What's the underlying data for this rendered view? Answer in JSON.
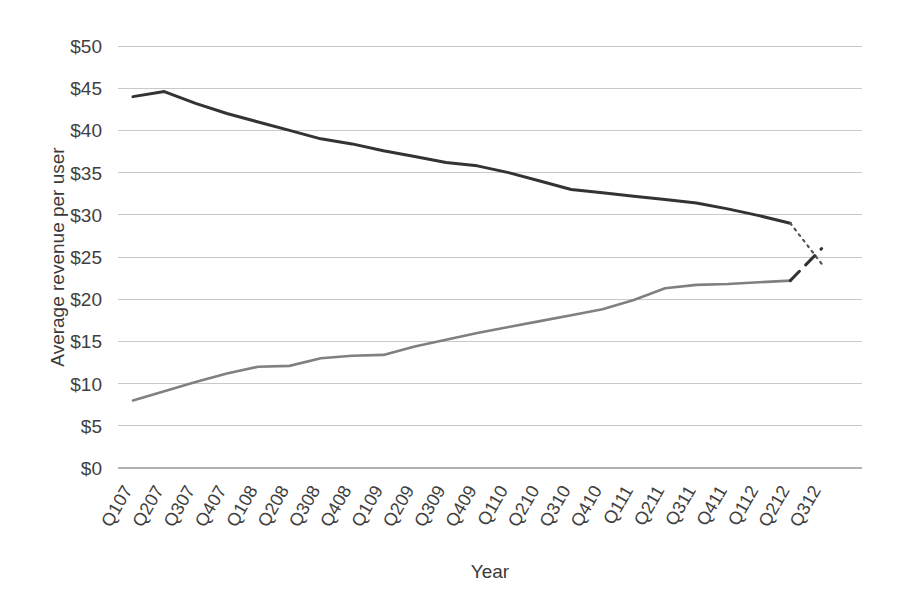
{
  "chart_data": {
    "type": "line",
    "title": "",
    "xlabel": "Year",
    "ylabel": "Average revenue per user",
    "ylim": [
      0,
      50
    ],
    "ytick_values": [
      0,
      5,
      10,
      15,
      20,
      25,
      30,
      35,
      40,
      45,
      50
    ],
    "ytick_labels": [
      "$0",
      "$5",
      "$10",
      "$15",
      "$20",
      "$25",
      "$30",
      "$35",
      "$40",
      "$45",
      "$50"
    ],
    "grid": true,
    "legend": "none",
    "categories": [
      "Q107",
      "Q207",
      "Q307",
      "Q407",
      "Q108",
      "Q208",
      "Q308",
      "Q408",
      "Q109",
      "Q209",
      "Q309",
      "Q409",
      "Q110",
      "Q210",
      "Q310",
      "Q410",
      "Q111",
      "Q211",
      "Q311",
      "Q411",
      "Q112",
      "Q212",
      "Q312"
    ],
    "series": [
      {
        "name": "declining-revenue-actual",
        "style": "solid",
        "color": "#333333",
        "width": 3.0,
        "values": [
          44.0,
          44.6,
          43.2,
          42.0,
          41.0,
          40.0,
          39.0,
          38.4,
          37.6,
          36.9,
          36.2,
          35.8,
          35.0,
          34.0,
          33.0,
          32.6,
          32.2,
          31.8,
          31.4,
          30.7,
          29.9,
          29.0,
          null
        ]
      },
      {
        "name": "declining-revenue-forecast",
        "style": "dotted",
        "color": "#555555",
        "width": 2.2,
        "values": [
          null,
          null,
          null,
          null,
          null,
          null,
          null,
          null,
          null,
          null,
          null,
          null,
          null,
          null,
          null,
          null,
          null,
          null,
          null,
          null,
          null,
          29.0,
          24.2
        ]
      },
      {
        "name": "growing-revenue-actual",
        "style": "solid",
        "color": "#808080",
        "width": 2.6,
        "values": [
          8.0,
          9.1,
          10.2,
          11.2,
          12.0,
          12.1,
          13.0,
          13.3,
          13.4,
          14.4,
          15.2,
          16.0,
          16.7,
          17.4,
          18.1,
          18.8,
          19.9,
          21.3,
          21.7,
          21.8,
          22.0,
          22.2,
          null
        ]
      },
      {
        "name": "growing-revenue-forecast",
        "style": "dashed",
        "color": "#333333",
        "width": 3.0,
        "values": [
          null,
          null,
          null,
          null,
          null,
          null,
          null,
          null,
          null,
          null,
          null,
          null,
          null,
          null,
          null,
          null,
          null,
          null,
          null,
          null,
          null,
          22.2,
          26.0
        ]
      }
    ]
  },
  "layout": {
    "plot_left": 118,
    "plot_right": 862,
    "plot_top": 46,
    "plot_bottom": 468,
    "xtick_rotation": -60,
    "xtick_start": 133,
    "xtick_step": 31.3
  },
  "colors": {
    "grid": "#c9c9c9",
    "axis_text": "#3f3f3f",
    "dark_series": "#333333",
    "gray_series": "#808080",
    "background": "#ffffff"
  }
}
